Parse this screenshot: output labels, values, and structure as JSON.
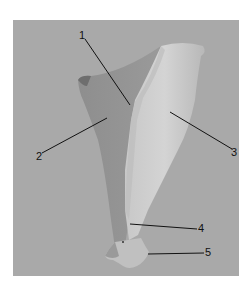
{
  "figure": {
    "background_color": "#a9a9a9",
    "labels": [
      {
        "id": "1",
        "text": "1"
      },
      {
        "id": "2",
        "text": "2"
      },
      {
        "id": "3",
        "text": "3"
      },
      {
        "id": "4",
        "text": "4"
      },
      {
        "id": "5",
        "text": "5"
      }
    ]
  }
}
